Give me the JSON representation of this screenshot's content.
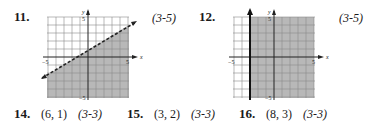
{
  "problems": [
    {
      "number": "11.",
      "ref": "(3-5)"
    },
    {
      "number": "12.",
      "ref": "(3-5)"
    },
    {
      "number": "14.",
      "point": "(6, 1)",
      "ref": "(3-3)"
    },
    {
      "number": "15.",
      "point": "(3, 2)",
      "ref": "(3-3)"
    },
    {
      "number": "16.",
      "point": "(8, 3)",
      "ref": "(3-3)"
    }
  ],
  "graphs": [
    {
      "x_label": "x",
      "y_label": "y",
      "x_min_label": "−5",
      "x_max_label": "5",
      "y_max_label": "5",
      "y_min_label": "−5",
      "boundary": "dashed line through (-5,-1.5) and (5,2.5)",
      "shading": "below"
    },
    {
      "x_label": "x",
      "y_label": "y",
      "x_min_label": "−5",
      "x_max_label": "5",
      "y_max_label": "5",
      "y_min_label": "−5",
      "boundary": "solid vertical line x = -3",
      "shading": "right"
    }
  ],
  "colors": {
    "shade": "#b8b8b8",
    "grid": "#8a8a8a",
    "axis": "#222222"
  }
}
